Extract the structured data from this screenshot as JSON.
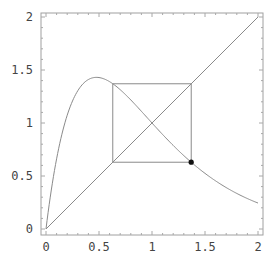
{
  "chart_data": {
    "type": "line",
    "title": "",
    "xlabel": "",
    "ylabel": "",
    "xlim": [
      0,
      2
    ],
    "ylim": [
      0,
      2
    ],
    "grid": false,
    "legend": null,
    "x_ticks": [
      "0",
      "0.5",
      "1",
      "1.5",
      "2"
    ],
    "y_ticks": [
      "0",
      "0.5",
      "1",
      "1.5",
      "2"
    ],
    "series": [
      {
        "name": "map curve f(x) = x·exp(2.1(1−x))",
        "kind": "curve",
        "x": [
          0,
          0.1,
          0.2,
          0.3,
          0.4,
          0.476,
          0.6,
          0.7,
          0.8,
          0.9,
          1.0,
          1.2,
          1.4,
          1.6,
          1.8,
          2.0
        ],
        "y": [
          0,
          0.66,
          1.07,
          1.31,
          1.42,
          1.43,
          1.39,
          1.32,
          1.22,
          1.11,
          1.0,
          0.79,
          0.6,
          0.45,
          0.34,
          0.245
        ]
      },
      {
        "name": "identity line y = x",
        "kind": "line",
        "x": [
          0,
          2
        ],
        "y": [
          0,
          2
        ]
      },
      {
        "name": "period-2 cobweb cycle",
        "kind": "polyline",
        "x": [
          0.63,
          0.63,
          1.37,
          1.37,
          0.63
        ],
        "y": [
          0.63,
          1.37,
          1.37,
          0.63,
          0.63
        ]
      },
      {
        "name": "marked point",
        "kind": "point",
        "x": [
          1.37
        ],
        "y": [
          0.63
        ]
      }
    ],
    "colors": {
      "line": "#808080",
      "frame": "#999999",
      "point": "#111111",
      "text": "#444444"
    }
  }
}
